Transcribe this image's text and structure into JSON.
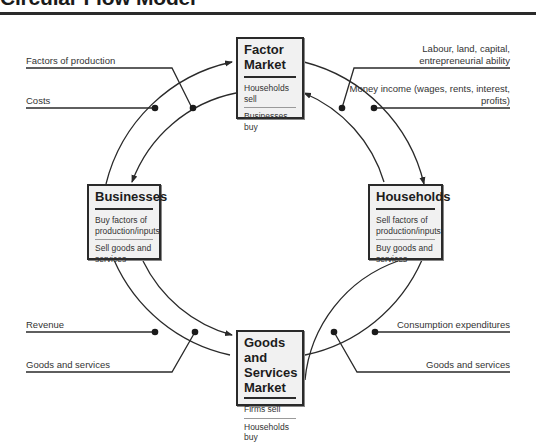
{
  "title": "Circular Flow Model",
  "boxes": {
    "factor_market": {
      "heading": "Factor Market",
      "items": [
        "Households sell",
        "Businesses buy"
      ]
    },
    "businesses": {
      "heading": "Businesses",
      "items": [
        "Buy factors of production/inputs",
        "Sell goods and services"
      ]
    },
    "households": {
      "heading": "Households",
      "items": [
        "Sell factors of production/inputs",
        "Buy goods and services"
      ]
    },
    "goods_market": {
      "heading": "Goods and Services Market",
      "items": [
        "Firms sell",
        "Households buy"
      ]
    }
  },
  "flow_labels": {
    "top_left": [
      "Factors of production",
      "Costs"
    ],
    "top_right": [
      "Labour, land, capital, entrepreneurial ability",
      "Money income (wages, rents, interest, profits)"
    ],
    "bottom_left": [
      "Revenue",
      "Goods and services"
    ],
    "bottom_right": [
      "Consumption expenditures",
      "Goods and services"
    ]
  },
  "colors": {
    "line": "#2a2a2a",
    "box_fill": "#f1f1f1",
    "text": "#333333"
  }
}
